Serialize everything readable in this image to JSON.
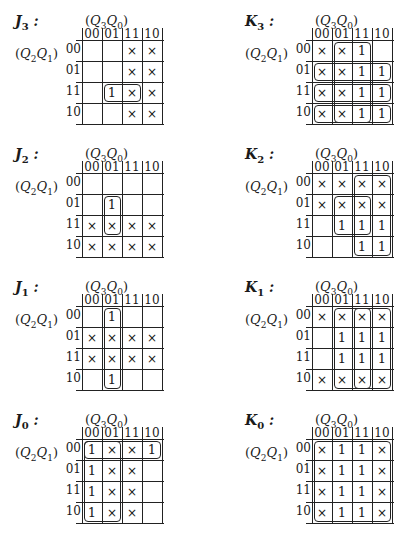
{
  "col_variable": "(Q3Q0)",
  "row_variable": "(Q2Q1)",
  "col_headers": [
    "00",
    "01",
    "11",
    "10"
  ],
  "row_headers": [
    "00",
    "01",
    "11",
    "10"
  ],
  "maps": [
    {
      "id": "J3",
      "name": "J",
      "sub": "3",
      "x": 15,
      "y": 13,
      "cells": [
        [
          "",
          "",
          "×",
          "×"
        ],
        [
          "",
          "",
          "×",
          "×"
        ],
        [
          "",
          "1",
          "×",
          "×"
        ],
        [
          "",
          "",
          "×",
          "×"
        ]
      ],
      "loops": [
        {
          "r": 2,
          "c": 1,
          "rs": 1,
          "cs": 2
        }
      ]
    },
    {
      "id": "K3",
      "name": "K",
      "sub": "3",
      "x": 245,
      "y": 13,
      "cells": [
        [
          "×",
          "×",
          "1",
          ""
        ],
        [
          "×",
          "×",
          "1",
          "1"
        ],
        [
          "×",
          "×",
          "1",
          "1"
        ],
        [
          "×",
          "×",
          "1",
          "1"
        ]
      ],
      "loops": [
        {
          "r": 0,
          "c": 1,
          "rs": 4,
          "cs": 2
        },
        {
          "r": 1,
          "c": 0,
          "rs": 1,
          "cs": 4
        },
        {
          "r": 2,
          "c": 0,
          "rs": 1,
          "cs": 4
        },
        {
          "r": 3,
          "c": 0,
          "rs": 1,
          "cs": 4
        }
      ]
    },
    {
      "id": "J2",
      "name": "J",
      "sub": "2",
      "x": 15,
      "y": 146,
      "cells": [
        [
          "",
          "",
          "",
          ""
        ],
        [
          "",
          "1",
          "",
          ""
        ],
        [
          "×",
          "×",
          "×",
          "×"
        ],
        [
          "×",
          "×",
          "×",
          "×"
        ]
      ],
      "loops": [
        {
          "r": 1,
          "c": 1,
          "rs": 2,
          "cs": 1
        }
      ]
    },
    {
      "id": "K2",
      "name": "K",
      "sub": "2",
      "x": 245,
      "y": 146,
      "cells": [
        [
          "×",
          "×",
          "×",
          "×"
        ],
        [
          "×",
          "×",
          "×",
          "×"
        ],
        [
          "",
          "1",
          "1",
          "1"
        ],
        [
          "",
          "",
          "1",
          "1"
        ]
      ],
      "loops": [
        {
          "r": 0,
          "c": 2,
          "rs": 4,
          "cs": 2
        },
        {
          "r": 1,
          "c": 1,
          "rs": 2,
          "cs": 2
        }
      ]
    },
    {
      "id": "J1",
      "name": "J",
      "sub": "1",
      "x": 15,
      "y": 279,
      "cells": [
        [
          "",
          "1",
          "",
          ""
        ],
        [
          "×",
          "×",
          "×",
          "×"
        ],
        [
          "×",
          "×",
          "×",
          "×"
        ],
        [
          "",
          "1",
          "",
          ""
        ]
      ],
      "loops": [
        {
          "r": 0,
          "c": 1,
          "rs": 4,
          "cs": 1
        }
      ]
    },
    {
      "id": "K1",
      "name": "K",
      "sub": "1",
      "x": 245,
      "y": 279,
      "cells": [
        [
          "×",
          "×",
          "×",
          "×"
        ],
        [
          "",
          "1",
          "1",
          "1"
        ],
        [
          "",
          "1",
          "1",
          "1"
        ],
        [
          "×",
          "×",
          "×",
          "×"
        ]
      ],
      "loops": [
        {
          "r": 0,
          "c": 1,
          "rs": 4,
          "cs": 3
        },
        {
          "r": 0,
          "c": 2,
          "rs": 4,
          "cs": 1
        }
      ]
    },
    {
      "id": "J0",
      "name": "J",
      "sub": "0",
      "x": 15,
      "y": 412,
      "cells": [
        [
          "1",
          "×",
          "×",
          "1"
        ],
        [
          "1",
          "×",
          "×",
          ""
        ],
        [
          "1",
          "×",
          "×",
          ""
        ],
        [
          "1",
          "×",
          "×",
          ""
        ]
      ],
      "loops": [
        {
          "r": 0,
          "c": 0,
          "rs": 4,
          "cs": 2
        },
        {
          "r": 0,
          "c": 0,
          "rs": 1,
          "cs": 4
        }
      ]
    },
    {
      "id": "K0",
      "name": "K",
      "sub": "0",
      "x": 245,
      "y": 412,
      "cells": [
        [
          "×",
          "1",
          "1",
          "×"
        ],
        [
          "×",
          "1",
          "1",
          "×"
        ],
        [
          "×",
          "1",
          "1",
          "×"
        ],
        [
          "×",
          "1",
          "1",
          "×"
        ]
      ],
      "loops": [
        {
          "r": 0,
          "c": 0,
          "rs": 4,
          "cs": 4
        }
      ]
    }
  ]
}
